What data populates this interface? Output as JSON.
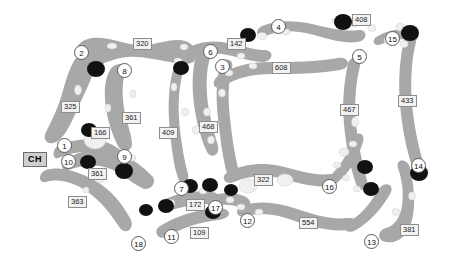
{
  "map": {
    "title": "Golf Course Layout",
    "width": 454,
    "height": 261,
    "background_color": "#ffffff",
    "fairway_color": "#a8a8a8",
    "green_color": "#111111",
    "bunker_color": "#f0f0f0",
    "label_box_fill": "#f2f2f2",
    "label_box_border": "#8d8d8d",
    "hole_circle_fill": "#ffffff",
    "hole_circle_border": "#5a5a5a",
    "clubhouse_fill": "#cfcfcf"
  },
  "clubhouse": {
    "label": "CH",
    "x": 23,
    "y": 152
  },
  "holes": [
    {
      "number": "1",
      "x": 57,
      "y": 138
    },
    {
      "number": "2",
      "x": 74,
      "y": 45
    },
    {
      "number": "3",
      "x": 215,
      "y": 59
    },
    {
      "number": "4",
      "x": 271,
      "y": 19
    },
    {
      "number": "5",
      "x": 352,
      "y": 49
    },
    {
      "number": "6",
      "x": 203,
      "y": 44
    },
    {
      "number": "7",
      "x": 174,
      "y": 181
    },
    {
      "number": "8",
      "x": 117,
      "y": 63
    },
    {
      "number": "9",
      "x": 117,
      "y": 149
    },
    {
      "number": "10",
      "x": 61,
      "y": 154
    },
    {
      "number": "11",
      "x": 164,
      "y": 229
    },
    {
      "number": "12",
      "x": 240,
      "y": 213
    },
    {
      "number": "13",
      "x": 364,
      "y": 234
    },
    {
      "number": "14",
      "x": 411,
      "y": 158
    },
    {
      "number": "15",
      "x": 385,
      "y": 31
    },
    {
      "number": "16",
      "x": 322,
      "y": 179
    },
    {
      "number": "17",
      "x": 208,
      "y": 200
    },
    {
      "number": "18",
      "x": 131,
      "y": 236
    }
  ],
  "yardages": [
    {
      "value": "320",
      "x": 133,
      "y": 38
    },
    {
      "value": "325",
      "x": 61,
      "y": 101
    },
    {
      "value": "361",
      "x": 122,
      "y": 112
    },
    {
      "value": "166",
      "x": 91,
      "y": 127
    },
    {
      "value": "361",
      "x": 88,
      "y": 168
    },
    {
      "value": "363",
      "x": 68,
      "y": 196
    },
    {
      "value": "142",
      "x": 227,
      "y": 38
    },
    {
      "value": "608",
      "x": 272,
      "y": 62
    },
    {
      "value": "408",
      "x": 352,
      "y": 14
    },
    {
      "value": "467",
      "x": 340,
      "y": 104
    },
    {
      "value": "433",
      "x": 398,
      "y": 95
    },
    {
      "value": "409",
      "x": 159,
      "y": 127
    },
    {
      "value": "468",
      "x": 199,
      "y": 121
    },
    {
      "value": "172",
      "x": 186,
      "y": 199
    },
    {
      "value": "109",
      "x": 190,
      "y": 227
    },
    {
      "value": "322",
      "x": 254,
      "y": 174
    },
    {
      "value": "554",
      "x": 299,
      "y": 217
    },
    {
      "value": "381",
      "x": 400,
      "y": 224
    }
  ]
}
